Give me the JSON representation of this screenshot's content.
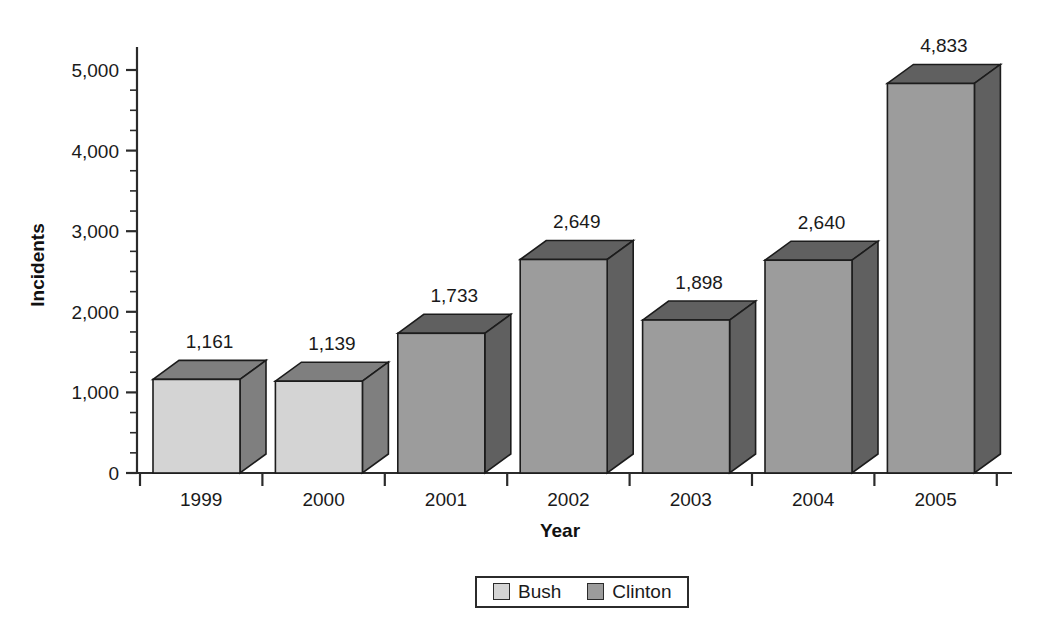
{
  "chart_data": {
    "type": "bar",
    "title": "",
    "xlabel": "Year",
    "ylabel": "Incidents",
    "categories": [
      "1999",
      "2000",
      "2001",
      "2002",
      "2003",
      "2004",
      "2005"
    ],
    "values": [
      1161,
      1139,
      1733,
      2649,
      1898,
      2640,
      4833
    ],
    "value_labels": [
      "1,161",
      "1,139",
      "1,733",
      "2,649",
      "1,898",
      "2,640",
      "4,833"
    ],
    "series_by_category": [
      "Bush",
      "Bush",
      "Clinton",
      "Clinton",
      "Clinton",
      "Clinton",
      "Clinton"
    ],
    "ylim": [
      0,
      5000
    ],
    "ytick_values": [
      0,
      1000,
      2000,
      3000,
      4000,
      5000
    ],
    "ytick_labels": [
      "0",
      "1,000",
      "2,000",
      "3,000",
      "4,000",
      "5,000"
    ],
    "yminor_step": 250,
    "grid": false,
    "legend_position": "bottom-center",
    "legend": [
      {
        "name": "Bush",
        "color": "#d0d0d0"
      },
      {
        "name": "Clinton",
        "color": "#9a9a9a"
      }
    ],
    "colors": {
      "bush_front": "#d4d4d4",
      "bush_top": "#7f7f7f",
      "bush_side": "#7f7f7f",
      "clinton_front": "#9c9c9c",
      "clinton_top": "#606060",
      "clinton_side": "#606060",
      "outline": "#1c1c1c",
      "axis": "#2b2b2b",
      "background": "#ffffff",
      "text": "#1a1a1a"
    }
  }
}
